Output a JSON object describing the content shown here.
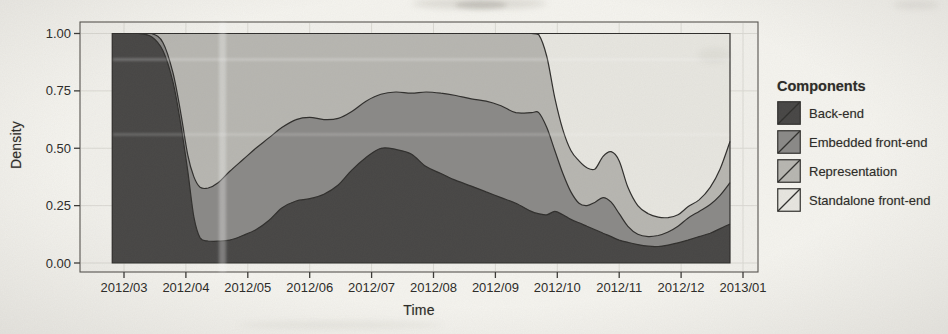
{
  "chart": {
    "y_axis": {
      "label": "Density",
      "ticks": [
        {
          "label": "1.00",
          "value": 1.0
        },
        {
          "label": "0.75",
          "value": 0.75
        },
        {
          "label": "0.50",
          "value": 0.5
        },
        {
          "label": "0.25",
          "value": 0.25
        },
        {
          "label": "0.00",
          "value": 0.0
        }
      ]
    },
    "x_axis": {
      "label": "Time",
      "ticks": [
        "2012/03",
        "2012/04",
        "2012/05",
        "2012/06",
        "2012/07",
        "2012/08",
        "2012/09",
        "2012/10",
        "2012/11",
        "2012/12",
        "2013/01"
      ]
    },
    "colors": {
      "backend": "#474645",
      "embedded": "#8a8987",
      "representation": "#b7b6b1",
      "standalone": "#e7e6e0",
      "boundary_line": "#2f2e2c",
      "grid": "#dad9d3",
      "panel_bg": "#f1f0eb",
      "panel_border": "#55534f",
      "tick_text": "#2b2a27"
    }
  },
  "legend": {
    "title": "Components",
    "items": [
      {
        "label": "Back-end",
        "color": "#474645"
      },
      {
        "label": "Embedded front-end",
        "color": "#8a8987"
      },
      {
        "label": "Representation",
        "color": "#b7b6b1"
      },
      {
        "label": "Standalone front-end",
        "color": "#e7e6e0"
      }
    ]
  },
  "chart_data": {
    "type": "area",
    "stacked": true,
    "normalized_to_1": true,
    "title": "",
    "xlabel": "Time",
    "ylabel": "Density",
    "ylim": [
      0,
      1
    ],
    "x_unit": "months since 2012/03",
    "x_tick_labels": [
      "2012/03",
      "2012/04",
      "2012/05",
      "2012/06",
      "2012/07",
      "2012/08",
      "2012/09",
      "2012/10",
      "2012/11",
      "2012/12",
      "2013/01"
    ],
    "legend_position": "right",
    "grid": true,
    "x": [
      -0.19,
      0.23,
      0.45,
      0.63,
      0.79,
      0.92,
      1.03,
      1.13,
      1.23,
      1.36,
      1.52,
      1.71,
      1.92,
      2.13,
      2.34,
      2.55,
      2.78,
      3.0,
      3.23,
      3.46,
      3.68,
      3.91,
      4.15,
      4.39,
      4.64,
      4.88,
      5.12,
      5.36,
      5.61,
      5.85,
      6.09,
      6.33,
      6.58,
      6.7,
      6.83,
      6.96,
      7.09,
      7.22,
      7.35,
      7.48,
      7.61,
      7.74,
      7.87,
      8.0,
      8.14,
      8.3,
      8.47,
      8.63,
      8.79,
      8.95,
      9.11,
      9.29,
      9.47,
      9.63,
      9.79
    ],
    "series": [
      {
        "name": "Back-end",
        "values": [
          1.0,
          1.0,
          0.985,
          0.925,
          0.79,
          0.6,
          0.4,
          0.2,
          0.11,
          0.096,
          0.095,
          0.1,
          0.12,
          0.145,
          0.185,
          0.24,
          0.27,
          0.28,
          0.3,
          0.34,
          0.405,
          0.46,
          0.5,
          0.495,
          0.475,
          0.42,
          0.39,
          0.36,
          0.335,
          0.31,
          0.285,
          0.26,
          0.225,
          0.215,
          0.21,
          0.225,
          0.21,
          0.19,
          0.175,
          0.16,
          0.145,
          0.13,
          0.115,
          0.1,
          0.09,
          0.08,
          0.073,
          0.072,
          0.078,
          0.088,
          0.1,
          0.115,
          0.13,
          0.15,
          0.17
        ]
      },
      {
        "name": "Embedded front-end",
        "values": [
          0,
          0,
          0.015,
          0.035,
          0.04,
          0.05,
          0.07,
          0.175,
          0.22,
          0.231,
          0.255,
          0.3,
          0.33,
          0.355,
          0.36,
          0.35,
          0.355,
          0.355,
          0.325,
          0.29,
          0.255,
          0.245,
          0.235,
          0.25,
          0.265,
          0.325,
          0.35,
          0.37,
          0.38,
          0.395,
          0.4,
          0.395,
          0.43,
          0.44,
          0.38,
          0.265,
          0.18,
          0.12,
          0.085,
          0.09,
          0.12,
          0.155,
          0.15,
          0.115,
          0.07,
          0.045,
          0.042,
          0.048,
          0.057,
          0.072,
          0.095,
          0.11,
          0.125,
          0.145,
          0.18
        ]
      },
      {
        "name": "Representation",
        "values": [
          0,
          0,
          0,
          0.04,
          0.17,
          0.35,
          0.53,
          0.625,
          0.67,
          0.673,
          0.65,
          0.6,
          0.55,
          0.5,
          0.455,
          0.41,
          0.375,
          0.365,
          0.375,
          0.37,
          0.34,
          0.295,
          0.265,
          0.255,
          0.26,
          0.255,
          0.26,
          0.27,
          0.285,
          0.295,
          0.315,
          0.345,
          0.345,
          0.34,
          0.31,
          0.23,
          0.19,
          0.18,
          0.185,
          0.165,
          0.145,
          0.18,
          0.22,
          0.23,
          0.17,
          0.125,
          0.1,
          0.08,
          0.063,
          0.05,
          0.05,
          0.05,
          0.075,
          0.115,
          0.18
        ]
      },
      {
        "name": "Standalone front-end",
        "values": [
          0,
          0,
          0,
          0,
          0,
          0,
          0,
          0,
          0,
          0,
          0,
          0,
          0,
          0,
          0,
          0,
          0,
          0,
          0,
          0,
          0,
          0,
          0,
          0,
          0,
          0,
          0,
          0,
          0,
          0,
          0,
          0,
          0,
          0.005,
          0.1,
          0.28,
          0.42,
          0.51,
          0.555,
          0.585,
          0.59,
          0.535,
          0.515,
          0.555,
          0.67,
          0.75,
          0.785,
          0.8,
          0.802,
          0.79,
          0.755,
          0.725,
          0.67,
          0.59,
          0.47
        ]
      }
    ]
  }
}
